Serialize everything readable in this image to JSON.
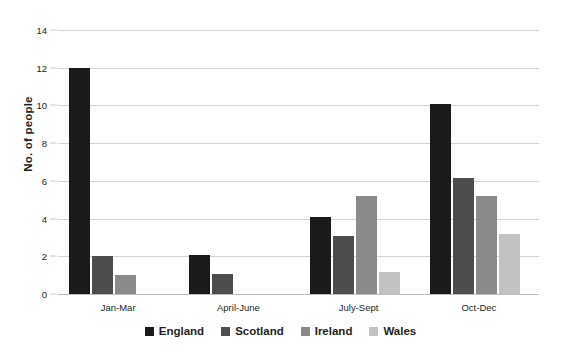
{
  "chart_data": {
    "type": "bar",
    "title": "",
    "xlabel": "",
    "ylabel": "No. of people",
    "ylim": [
      0,
      14
    ],
    "yticks": [
      0,
      2,
      4,
      6,
      8,
      10,
      12,
      14
    ],
    "grid": true,
    "legend_position": "bottom",
    "categories": [
      "Jan-Mar",
      "April-June",
      "July-Sept",
      "Oct-Dec"
    ],
    "series": [
      {
        "name": "England",
        "color": "#1a1a1a",
        "values": [
          12,
          2.05,
          4.1,
          10.1
        ]
      },
      {
        "name": "Scotland",
        "color": "#4d4d4d",
        "values": [
          2,
          1.05,
          3.1,
          6.15
        ]
      },
      {
        "name": "Ireland",
        "color": "#8a8a8a",
        "values": [
          1,
          0,
          5.2,
          5.2
        ]
      },
      {
        "name": "Wales",
        "color": "#c2c2c2",
        "values": [
          0,
          0,
          1.15,
          3.2
        ]
      }
    ]
  }
}
